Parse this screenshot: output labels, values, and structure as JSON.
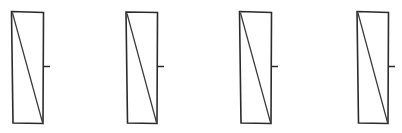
{
  "figure": {
    "background_color": "#ffffff",
    "canvas": {
      "width": 402,
      "height": 133
    },
    "stroke_color": "#2b2b2b",
    "diagonal_color": "#3a3a3a",
    "tick_color": "#2b2b2b",
    "panel_count": 4,
    "panels": [
      {
        "label": "panel-1",
        "outline_points": "11.5,11.5 43.5,12.5 43.0,123.5 13.0,123.0",
        "diagonal": {
          "x1": 12.5,
          "y1": 13.0,
          "x2": 42.5,
          "y2": 122.5
        },
        "tick": {
          "x1": 43.2,
          "y1": 66.5,
          "x2": 50.0,
          "y2": 66.5
        }
      },
      {
        "label": "panel-2",
        "outline_points": "126.0,12.0 157.5,12.5 157.0,123.5 127.5,123.0",
        "diagonal": {
          "x1": 127.0,
          "y1": 13.5,
          "x2": 156.5,
          "y2": 122.5
        },
        "tick": {
          "x1": 157.2,
          "y1": 66.5,
          "x2": 164.0,
          "y2": 66.5
        }
      },
      {
        "label": "panel-3",
        "outline_points": "239.5,11.5 271.5,12.5 271.0,123.5 241.0,123.0",
        "diagonal": {
          "x1": 240.5,
          "y1": 13.0,
          "x2": 270.5,
          "y2": 122.5
        },
        "tick": {
          "x1": 271.2,
          "y1": 66.5,
          "x2": 278.0,
          "y2": 66.5
        }
      },
      {
        "label": "panel-4",
        "outline_points": "357.0,11.5 388.5,12.5 388.0,123.5 358.5,123.0",
        "diagonal": {
          "x1": 358.0,
          "y1": 13.0,
          "x2": 387.5,
          "y2": 122.5
        },
        "tick": {
          "x1": 388.2,
          "y1": 66.5,
          "x2": 395.0,
          "y2": 66.5
        }
      }
    ]
  }
}
